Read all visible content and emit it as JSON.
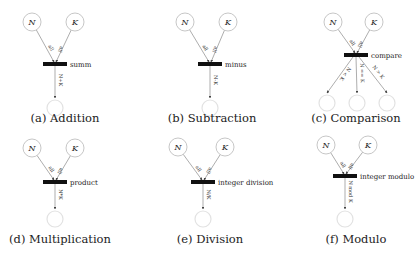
{
  "panels": [
    {
      "id": "a",
      "caption": "(a) Addition",
      "inputs": [
        "N",
        "K"
      ],
      "input_arc_label": "all",
      "transition": "summ",
      "outputs": [
        "N+K"
      ]
    },
    {
      "id": "b",
      "caption": "(b) Subtraction",
      "inputs": [
        "N",
        "K"
      ],
      "input_arc_label": "all",
      "transition": "minus",
      "outputs": [
        "N-K"
      ]
    },
    {
      "id": "c",
      "caption": "(c) Comparison",
      "inputs": [
        "N",
        "K"
      ],
      "input_arc_label": "all",
      "transition": "compare",
      "outputs": [
        "N < K",
        "N == K",
        "N > K"
      ]
    },
    {
      "id": "d",
      "caption": "(d) Multiplication",
      "inputs": [
        "N",
        "K"
      ],
      "input_arc_label": "all",
      "transition": "product",
      "outputs": [
        "N*K"
      ]
    },
    {
      "id": "e",
      "caption": "(e) Division",
      "inputs": [
        "N",
        "K"
      ],
      "input_arc_label": "all",
      "transition": "integer division",
      "outputs": [
        "N/K"
      ]
    },
    {
      "id": "f",
      "caption": "(f) Modulo",
      "inputs": [
        "N",
        "K"
      ],
      "input_arc_label": "all",
      "transition": "integer modulo",
      "outputs": [
        "N mod K"
      ]
    }
  ]
}
